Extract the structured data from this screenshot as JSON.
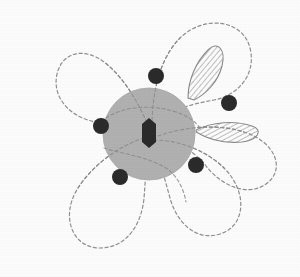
{
  "figure": {
    "name": "orbital-lobe-diagram",
    "title": "",
    "caption": "",
    "width": 300,
    "height": 277,
    "background_color": "#fbfbfb"
  },
  "colors": {
    "background": "#fbfbfb",
    "central_sphere_fill": "#b0b0b0",
    "central_sphere_stroke": "#a8a8a8",
    "core_shape_fill": "#2a2a2a",
    "atom_dot_fill": "#2b2b2b",
    "dashed_petal_stroke": "#8f8f8f",
    "hatch_outline_stroke": "#8a8a8a",
    "hatch_line_stroke": "#8a8a8a"
  },
  "central_sphere": {
    "label": "central-sphere",
    "cx": 149,
    "cy": 134,
    "r": 46,
    "fill": "#b0b0b0"
  },
  "core_shape": {
    "label": "core-hexagon",
    "cx": 149,
    "cy": 133,
    "half_width": 7,
    "half_height": 15,
    "fill": "#2a2a2a"
  },
  "atom_dots": [
    {
      "id": "dot-top",
      "cx": 156,
      "cy": 76,
      "r": 8
    },
    {
      "id": "dot-left",
      "cx": 101,
      "cy": 126,
      "r": 8
    },
    {
      "id": "dot-right",
      "cx": 229,
      "cy": 103,
      "r": 8
    },
    {
      "id": "dot-bottom-left",
      "cx": 120,
      "cy": 177,
      "r": 8
    },
    {
      "id": "dot-bottom-right",
      "cx": 196,
      "cy": 165,
      "r": 8
    }
  ],
  "dashed_petals": [
    {
      "id": "petal-top",
      "path": "M 149 128 C 136 96 120 74 104 62 C 84 47 62 52 57 74 C 52 96 68 114 88 120 C 104 125 124 124 140 130 Z"
    },
    {
      "id": "petal-upper-right",
      "path": "M 152 126 C 152 92 160 58 180 38 C 205 14 243 20 250 48 C 257 76 236 96 214 100 C 192 104 168 110 156 124 Z"
    },
    {
      "id": "petal-left-lower",
      "path": "M 144 138 C 118 146 92 166 78 188 C 60 216 72 248 100 248 C 128 248 142 222 144 198 C 146 176 146 154 148 142 Z"
    },
    {
      "id": "petal-right-lower",
      "path": "M 154 140 C 178 140 206 150 224 168 C 248 192 246 226 220 234 C 194 242 176 220 170 198 C 164 176 158 154 152 144 Z"
    },
    {
      "id": "petal-far-right",
      "path": "M 158 136 C 186 126 220 124 244 132 C 276 142 286 170 266 184 C 246 198 220 184 206 166 C 192 148 172 140 158 138 Z"
    }
  ],
  "hatched_lobes": [
    {
      "id": "hatched-lobe-upper",
      "description": "tilted lens with diagonal hatching",
      "path": "M 188 98 C 188 80 196 62 208 50 C 218 40 226 50 222 66 C 218 82 206 94 194 100 Z",
      "hatch_angle_deg": 40,
      "hatch_spacing_px": 4
    },
    {
      "id": "hatched-lobe-right",
      "description": "horizontal lens with diagonal hatching",
      "path": "M 196 130 C 212 122 234 120 252 126 C 264 130 258 140 242 142 C 222 144 206 138 196 132 Z",
      "hatch_angle_deg": 60,
      "hatch_spacing_px": 4
    }
  ],
  "legend": {
    "items": []
  },
  "annotations": []
}
